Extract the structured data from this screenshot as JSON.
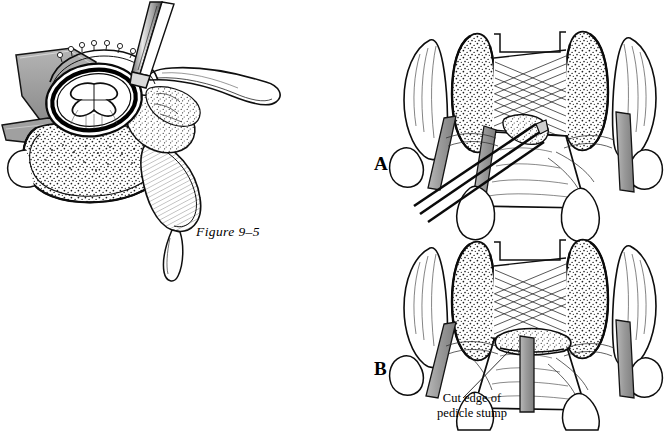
{
  "figure": {
    "caption": "Figure 9–5",
    "background_color": "#ffffff",
    "ink_color": "#000000",
    "shade_color": "#9a9a9a",
    "light_shade_color": "#c8c8c8"
  },
  "panels": [
    {
      "id": "left",
      "label": "",
      "name": "axial-vertebra-cross-section",
      "description": "Axial cross-section of vertebra with dural sac, spinal cord, retractor and osteotome"
    },
    {
      "id": "A",
      "label": "A",
      "name": "posterior-view-with-instrument",
      "description": "Posterior view of vertebral arch after laminectomy with osteotome entering pedicle"
    },
    {
      "id": "B",
      "label": "B",
      "name": "posterior-view-pedicle-resected",
      "description": "Posterior view after pedicle resection showing cut pedicle stump"
    }
  ],
  "callouts": [
    {
      "name": "cut-edge-pedicle-stump",
      "line1": "Cut edge of",
      "line2": "pedicle stump",
      "leader": true
    }
  ],
  "structures": {
    "dural_sac": "dural-sac",
    "spinal_cord": "spinal-cord",
    "vertebral_body": "vertebral-body",
    "spinous_process": "spinous-process",
    "transverse_process": "transverse-process",
    "lamina": "lamina",
    "pedicle": "pedicle",
    "nerve_root": "nerve-root",
    "ligamentum_flavum": "ligamentum-flavum",
    "retractor": "retractor",
    "osteotome": "osteotome"
  }
}
